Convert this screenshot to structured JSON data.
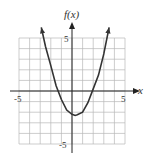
{
  "chart_data": {
    "type": "line",
    "title": "",
    "xlabel": "x",
    "ylabel": "f(x)",
    "xlim": [
      -5,
      5
    ],
    "ylim": [
      -5,
      5
    ],
    "grid": true,
    "tick_labels": {
      "x": [
        "-5",
        "5"
      ],
      "y": [
        "5",
        "-5"
      ]
    },
    "series": [
      {
        "name": "f(x)",
        "description": "upward-opening parabola with arrowheads at both ends",
        "x": [
          -2.9,
          -2.5,
          -2,
          -1.5,
          -1,
          -0.5,
          0,
          0.3,
          0.5,
          1,
          1.5,
          2,
          2.5,
          3,
          3.5
        ],
        "y": [
          6.0,
          4.2,
          2.4,
          0.5,
          -0.8,
          -1.8,
          -2.2,
          -2.3,
          -2.25,
          -2.0,
          -1.1,
          0.2,
          1.5,
          3.5,
          6.0
        ]
      }
    ],
    "vertex_approx": [
      0.3,
      -2.3
    ],
    "x_intercepts_approx": [
      -1.4,
      1.9
    ]
  },
  "labels": {
    "y_axis": "f(x)",
    "x_axis": "x",
    "x_min": "-5",
    "x_max": "5",
    "y_max": "5",
    "y_min": "-5"
  },
  "colors": {
    "grid": "#b8b8b8",
    "axis": "#222222",
    "curve": "#333333"
  }
}
